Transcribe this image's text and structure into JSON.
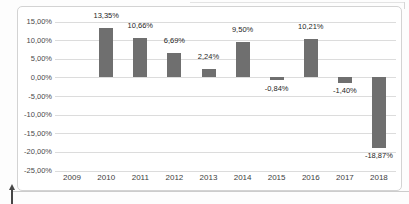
{
  "page": {
    "background": "#fdfdfd"
  },
  "chart": {
    "frame_border_color": "#d3d3d3",
    "frame_background": "#ffffff"
  },
  "chart_data": {
    "type": "bar",
    "title": "",
    "xlabel": "",
    "ylabel": "",
    "categories": [
      "2009",
      "2010",
      "2011",
      "2012",
      "2013",
      "2014",
      "2015",
      "2016",
      "2017",
      "2018"
    ],
    "values": [
      null,
      13.35,
      10.66,
      6.69,
      2.24,
      9.5,
      -0.84,
      10.21,
      -1.4,
      -18.87
    ],
    "bar_labels": [
      "",
      "13,35%",
      "10,66%",
      "6,69%",
      "2,24%",
      "9,50%",
      "-0,84%",
      "10,21%",
      "-1,40%",
      "-18,87%"
    ],
    "yticks": [
      15,
      10,
      5,
      0,
      -5,
      -10,
      -15,
      -20,
      -25
    ],
    "ytick_labels": [
      "15,00%",
      "10,00%",
      "5,00%",
      "0,00%",
      "-5,00%",
      "-10,00%",
      "-15,00%",
      "-20,00%",
      "-25,00%"
    ],
    "ylim": [
      -25,
      15
    ],
    "grid": "horizontal",
    "legend": "none",
    "bar_color": "#6f6f6f",
    "gridline_color": "#dcdcdc",
    "axis_text_color": "#4a4a4a",
    "label_text_color": "#262626"
  }
}
